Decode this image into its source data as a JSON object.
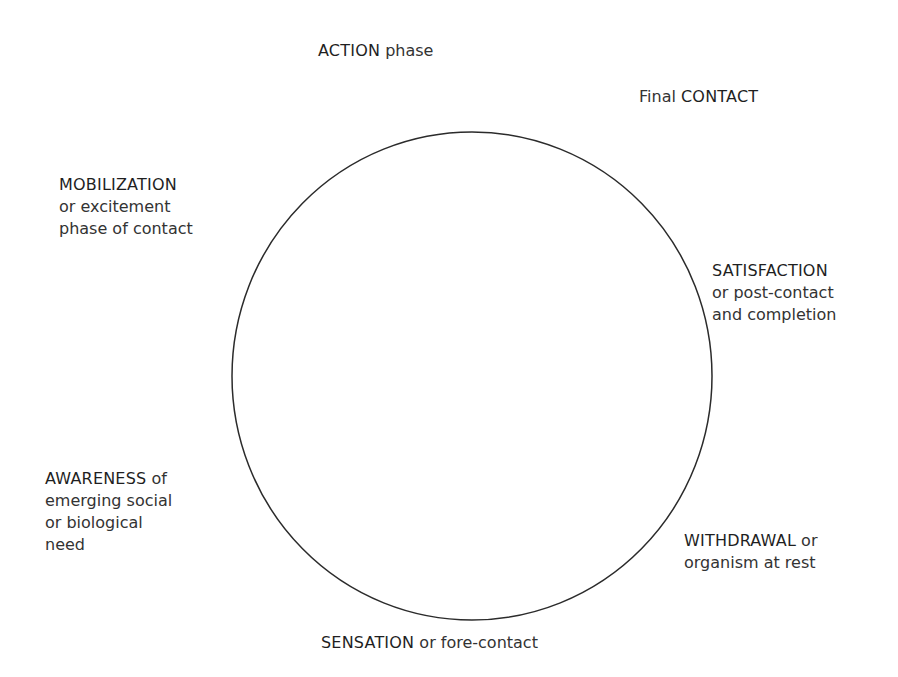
{
  "diagram": {
    "type": "gestalt-cycle-of-experience",
    "circle": {
      "cx": 472,
      "cy": 376,
      "rx": 240,
      "ry": 244,
      "stroke": "#2b2b2b"
    },
    "labels": {
      "action": {
        "caps": "ACTION",
        "rest": " phase"
      },
      "contact": {
        "pre": "Final ",
        "caps": "CONTACT"
      },
      "mobilization": {
        "caps": "MOBILIZATION",
        "line2": "or excitement",
        "line3": "phase of contact"
      },
      "satisfaction": {
        "caps": "SATISFACTION",
        "line2": "or post-contact",
        "line3": "and completion"
      },
      "awareness": {
        "caps": "AWARENESS",
        "rest": " of",
        "line2": "emerging social",
        "line3": "or biological",
        "line4": "need"
      },
      "withdrawal": {
        "caps": "WITHDRAWAL",
        "rest": " or",
        "line2": "organism at rest"
      },
      "sensation": {
        "caps": "SENSATION",
        "rest": " or fore-contact"
      }
    }
  }
}
